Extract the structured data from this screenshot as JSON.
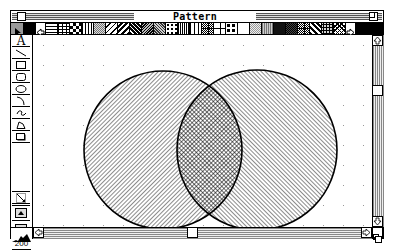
{
  "window": {
    "title": "Pattern Intersection-Layer#1"
  },
  "palette": {
    "selected_tool": "pointer",
    "swatches": [
      "white",
      "black",
      "fill-toggle",
      "hlines",
      "bricks",
      "checker",
      "grid",
      "gray-dots",
      "diag-right",
      "diag-right-thick",
      "diag-left",
      "diag-left-thick",
      "diag-fine",
      "diag-dense",
      "weave",
      "vlines",
      "plaid",
      "dots",
      "crosshatch",
      "tile",
      "white",
      "fine-dots",
      "gray",
      "black",
      "dark-gray",
      "tile",
      "diag-wave",
      "scales",
      "diag-mesh",
      "fill-toggle-2",
      "black"
    ]
  },
  "tools": [
    {
      "name": "text-tool",
      "glyph": "A"
    },
    {
      "name": "line-tool",
      "glyph": "line"
    },
    {
      "name": "rect-tool",
      "glyph": "rect"
    },
    {
      "name": "round-rect-tool",
      "glyph": "round-rect"
    },
    {
      "name": "oval-tool",
      "glyph": "oval"
    },
    {
      "name": "arc-tool",
      "glyph": "arc"
    },
    {
      "name": "freehand-tool",
      "glyph": "freehand"
    },
    {
      "name": "polygon-tool",
      "glyph": "polygon"
    },
    {
      "name": "shadow-tool",
      "glyph": "shadow-box"
    },
    {
      "name": "resize-tool",
      "glyph": "diagonal-arrow"
    },
    {
      "name": "zoom-in-button",
      "glyph": "up-triangle"
    },
    {
      "name": "zoom-out-button",
      "glyph": "down-triangle"
    }
  ],
  "zoom": {
    "level": "200"
  },
  "canvas": {
    "shapes": [
      {
        "type": "circle",
        "cx": 130,
        "cy": 115,
        "r": 79,
        "pattern": "diagonal-backslash"
      },
      {
        "type": "circle",
        "cx": 224,
        "cy": 115,
        "r": 80,
        "pattern": "diagonal-slash"
      }
    ],
    "intersection_pattern": "crosshatch"
  },
  "scrollbars": {
    "vertical": {
      "thumb_position_pct": 28
    },
    "horizontal": {
      "thumb_position_pct": 47
    }
  },
  "colors": {
    "foreground": "#000000",
    "background": "#ffffff",
    "scroll_track": "#aaaaaa"
  }
}
